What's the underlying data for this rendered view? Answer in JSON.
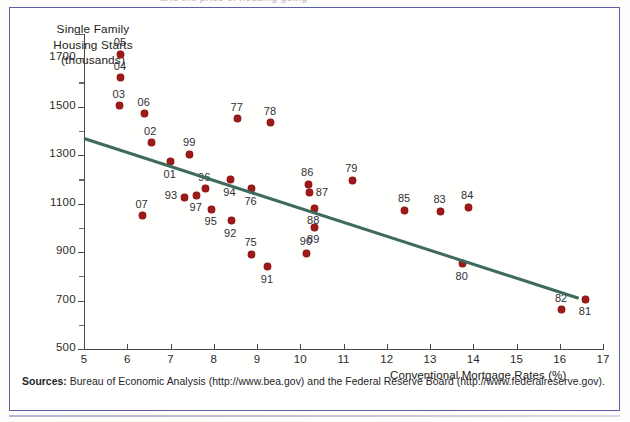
{
  "chart_data": {
    "type": "scatter",
    "title": "",
    "xlabel": "Conventional Mortgage Rates (%)",
    "ylabel": "Single Family Housing Starts (thousands)",
    "ylabel_lines": [
      "Single Family",
      "Housing Starts",
      "(thousands)"
    ],
    "xlim": [
      5,
      17
    ],
    "ylim": [
      500,
      1800
    ],
    "xticks": [
      5,
      6,
      7,
      8,
      9,
      10,
      11,
      12,
      13,
      14,
      15,
      16,
      17
    ],
    "yticks": [
      500,
      700,
      900,
      1100,
      1300,
      1500,
      1700
    ],
    "grid": false,
    "legend": null,
    "point_color": "#9e1a1a",
    "trendline_color": "#3f6b5e",
    "trendline": {
      "x": [
        5.0,
        16.45
      ],
      "y": [
        1373,
        713
      ]
    },
    "points": [
      {
        "label": "05",
        "x": 5.85,
        "y": 1716,
        "lx": -7,
        "ly": -18
      },
      {
        "label": "04",
        "x": 5.85,
        "y": 1620,
        "lx": -7,
        "ly": -18
      },
      {
        "label": "03",
        "x": 5.82,
        "y": 1504,
        "lx": -7,
        "ly": -18
      },
      {
        "label": "06",
        "x": 6.4,
        "y": 1470,
        "lx": -7,
        "ly": -18
      },
      {
        "label": "02",
        "x": 6.55,
        "y": 1351,
        "lx": -7,
        "ly": -18
      },
      {
        "label": "07",
        "x": 6.35,
        "y": 1050,
        "lx": -7,
        "ly": -18
      },
      {
        "label": "01",
        "x": 7.0,
        "y": 1273,
        "lx": -7,
        "ly": 6
      },
      {
        "label": "99",
        "x": 7.45,
        "y": 1303,
        "lx": -7,
        "ly": -18
      },
      {
        "label": "93",
        "x": 7.33,
        "y": 1126,
        "lx": -20,
        "ly": -8
      },
      {
        "label": "97",
        "x": 7.6,
        "y": 1134,
        "lx": -7,
        "ly": 6
      },
      {
        "label": "96",
        "x": 7.8,
        "y": 1161,
        "lx": -7,
        "ly": -18
      },
      {
        "label": "95",
        "x": 7.95,
        "y": 1076,
        "lx": -7,
        "ly": 6
      },
      {
        "label": "94",
        "x": 8.38,
        "y": 1198,
        "lx": -7,
        "ly": 6
      },
      {
        "label": "92",
        "x": 8.4,
        "y": 1030,
        "lx": -7,
        "ly": 6
      },
      {
        "label": "76",
        "x": 8.87,
        "y": 1162,
        "lx": -7,
        "ly": 6
      },
      {
        "label": "75",
        "x": 8.87,
        "y": 892,
        "lx": -7,
        "ly": -18
      },
      {
        "label": "91",
        "x": 9.25,
        "y": 840,
        "lx": -7,
        "ly": 6
      },
      {
        "label": "77",
        "x": 8.55,
        "y": 1451,
        "lx": -7,
        "ly": -18
      },
      {
        "label": "78",
        "x": 9.32,
        "y": 1433,
        "lx": -7,
        "ly": -18
      },
      {
        "label": "86",
        "x": 10.18,
        "y": 1180,
        "lx": -7,
        "ly": -18
      },
      {
        "label": "87",
        "x": 10.22,
        "y": 1146,
        "lx": 6,
        "ly": -6
      },
      {
        "label": "88",
        "x": 10.32,
        "y": 1081,
        "lx": -7,
        "ly": 6
      },
      {
        "label": "89",
        "x": 10.32,
        "y": 1003,
        "lx": -7,
        "ly": 6
      },
      {
        "label": "90",
        "x": 10.15,
        "y": 895,
        "lx": -7,
        "ly": -18
      },
      {
        "label": "79",
        "x": 11.2,
        "y": 1197,
        "lx": -7,
        "ly": -18
      },
      {
        "label": "85",
        "x": 12.42,
        "y": 1072,
        "lx": -7,
        "ly": -18
      },
      {
        "label": "83",
        "x": 13.24,
        "y": 1068,
        "lx": -7,
        "ly": -18
      },
      {
        "label": "84",
        "x": 13.88,
        "y": 1084,
        "lx": -7,
        "ly": -18
      },
      {
        "label": "80",
        "x": 13.75,
        "y": 852,
        "lx": -7,
        "ly": 6
      },
      {
        "label": "82",
        "x": 16.05,
        "y": 663,
        "lx": -7,
        "ly": -18
      },
      {
        "label": "81",
        "x": 16.6,
        "y": 705,
        "lx": -7,
        "ly": 6
      }
    ]
  },
  "footer": {
    "sources_label": "Sources:",
    "sources_text": "Bureau of Economic Analysis (http://www.bea.gov) and the Federal Reserve Board (http://www.federalreserve.gov)."
  },
  "top_fragment": "and the price of housing going"
}
